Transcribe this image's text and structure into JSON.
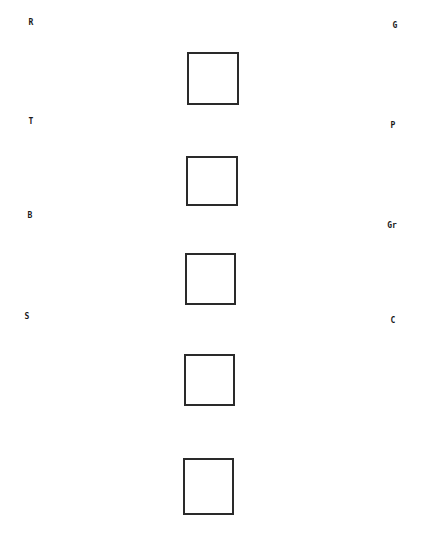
{
  "diagram": {
    "background": "#ffffff",
    "stroke_color": "#2a2a2a",
    "labels": [
      {
        "id": "R",
        "text": "R",
        "side": "left",
        "x": 31,
        "y": 23
      },
      {
        "id": "G",
        "text": "G",
        "side": "right",
        "x": 395,
        "y": 26
      },
      {
        "id": "T",
        "text": "T",
        "side": "left",
        "x": 31,
        "y": 122
      },
      {
        "id": "P",
        "text": "P",
        "side": "right",
        "x": 393,
        "y": 126
      },
      {
        "id": "B",
        "text": "B",
        "side": "left",
        "x": 30,
        "y": 216
      },
      {
        "id": "Gr",
        "text": "Gr",
        "side": "right",
        "x": 392,
        "y": 226
      },
      {
        "id": "S",
        "text": "S",
        "side": "left",
        "x": 27,
        "y": 317
      },
      {
        "id": "C",
        "text": "C",
        "side": "right",
        "x": 393,
        "y": 321
      }
    ],
    "boxes": [
      {
        "index": 1,
        "x": 187,
        "y": 52,
        "w": 52,
        "h": 53
      },
      {
        "index": 2,
        "x": 186,
        "y": 156,
        "w": 52,
        "h": 50
      },
      {
        "index": 3,
        "x": 185,
        "y": 253,
        "w": 51,
        "h": 52
      },
      {
        "index": 4,
        "x": 184,
        "y": 354,
        "w": 51,
        "h": 52
      },
      {
        "index": 5,
        "x": 183,
        "y": 458,
        "w": 51,
        "h": 57
      }
    ]
  }
}
